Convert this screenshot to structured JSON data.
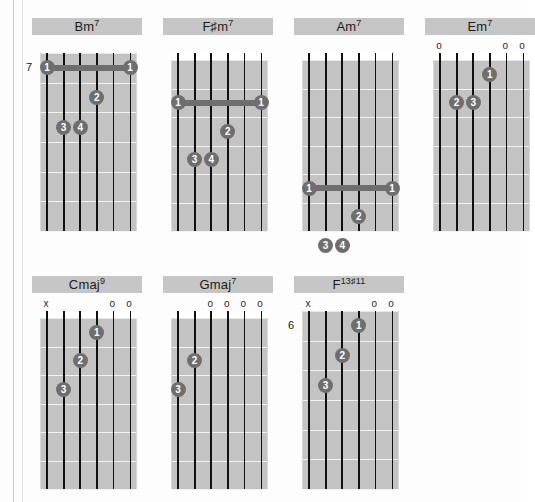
{
  "page": {
    "background_color": "#fdfdfd",
    "grid_color": "#c3c3c3",
    "dot_color": "#6e6e6e",
    "string_color": "#111111",
    "label_bg_color": "#c6c6c6"
  },
  "legend": {
    "open_string_symbol": "o",
    "muted_string_symbol": "x"
  },
  "chord_rows": [
    {
      "row_index": 0,
      "chords": [
        {
          "name": "Bm",
          "extension": "7",
          "label_text": "Bm7",
          "position_label": "7",
          "show_nut": false,
          "string_marks": [
            "",
            "",
            "",
            "",
            "",
            ""
          ],
          "barre": {
            "fret": 1,
            "from_string": 1,
            "to_string": 6,
            "finger": "1"
          },
          "dots": [
            {
              "string": 4,
              "fret": 2,
              "finger": "2"
            },
            {
              "string": 2,
              "fret": 3,
              "finger": "3"
            },
            {
              "string": 3,
              "fret": 3,
              "finger": "4"
            }
          ]
        },
        {
          "name": "F♯m",
          "extension": "7",
          "label_text": "F♯m7",
          "position_label": "",
          "show_nut": true,
          "string_marks": [
            "",
            "",
            "",
            "",
            "",
            ""
          ],
          "barre": {
            "fret": 2,
            "from_string": 1,
            "to_string": 6,
            "finger": "1"
          },
          "dots": [
            {
              "string": 4,
              "fret": 3,
              "finger": "2"
            },
            {
              "string": 2,
              "fret": 4,
              "finger": "3"
            },
            {
              "string": 3,
              "fret": 4,
              "finger": "4"
            }
          ]
        },
        {
          "name": "Am",
          "extension": "7",
          "label_text": "Am7",
          "position_label": "",
          "show_nut": true,
          "string_marks": [
            "",
            "",
            "",
            "",
            "",
            ""
          ],
          "barre": {
            "fret": 5,
            "from_string": 1,
            "to_string": 6,
            "finger": "1"
          },
          "dots": [
            {
              "string": 4,
              "fret": 6,
              "finger": "2"
            },
            {
              "string": 2,
              "fret": 7,
              "finger": "3"
            },
            {
              "string": 3,
              "fret": 7,
              "finger": "4"
            }
          ]
        },
        {
          "name": "Em",
          "extension": "7",
          "label_text": "Em7",
          "position_label": "",
          "show_nut": true,
          "string_marks": [
            "o",
            "",
            "",
            "",
            "o",
            "o"
          ],
          "barre": null,
          "dots": [
            {
              "string": 4,
              "fret": 1,
              "finger": "1"
            },
            {
              "string": 2,
              "fret": 2,
              "finger": "2"
            },
            {
              "string": 3,
              "fret": 2,
              "finger": "3"
            }
          ]
        }
      ]
    },
    {
      "row_index": 1,
      "chords": [
        {
          "name": "Cmaj",
          "extension": "9",
          "label_text": "Cmaj9",
          "position_label": "",
          "show_nut": true,
          "string_marks": [
            "x",
            "",
            "",
            "",
            "o",
            "o"
          ],
          "barre": null,
          "dots": [
            {
              "string": 4,
              "fret": 1,
              "finger": "1"
            },
            {
              "string": 3,
              "fret": 2,
              "finger": "2"
            },
            {
              "string": 2,
              "fret": 3,
              "finger": "3"
            }
          ]
        },
        {
          "name": "Gmaj",
          "extension": "7",
          "label_text": "Gmaj7",
          "position_label": "",
          "show_nut": true,
          "string_marks": [
            "",
            "",
            "o",
            "o",
            "o",
            "o"
          ],
          "barre": null,
          "dots": [
            {
              "string": 2,
              "fret": 2,
              "finger": "2"
            },
            {
              "string": 1,
              "fret": 3,
              "finger": "3"
            }
          ]
        },
        {
          "name": "F",
          "extension": "13♯11",
          "label_text": "F13♯11",
          "position_label": "6",
          "show_nut": false,
          "string_marks": [
            "x",
            "",
            "",
            "",
            "o",
            "o"
          ],
          "barre": null,
          "dots": [
            {
              "string": 4,
              "fret": 1,
              "finger": "1"
            },
            {
              "string": 3,
              "fret": 2,
              "finger": "2"
            },
            {
              "string": 2,
              "fret": 3,
              "finger": "3"
            }
          ]
        }
      ]
    }
  ]
}
